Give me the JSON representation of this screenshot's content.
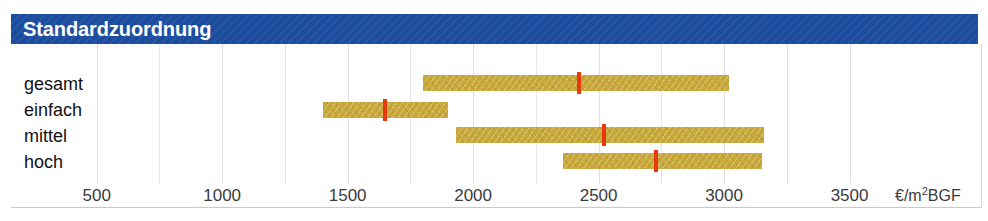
{
  "title": "Standardzuordnung",
  "colors": {
    "header_bg": "#1c4c9e",
    "header_text": "#ffffff",
    "bar_fill": "#c9a83a",
    "marker": "#e8380d",
    "gridline": "#e6e7ea",
    "text": "#111113"
  },
  "axis": {
    "unit_label": "€/m",
    "unit_exponent": "2",
    "unit_suffix": "BGF",
    "ticks": [
      {
        "label": "500",
        "value": 500
      },
      {
        "label": "1000",
        "value": 1000
      },
      {
        "label": "1500",
        "value": 1500
      },
      {
        "label": "2000",
        "value": 2000
      },
      {
        "label": "2500",
        "value": 2500
      },
      {
        "label": "3000",
        "value": 3000
      },
      {
        "label": "3500",
        "value": 3500
      }
    ],
    "gridline_values": [
      500,
      750,
      1000,
      1250,
      1500,
      1750,
      2000,
      2250,
      2500,
      2750,
      3000,
      3250,
      3500
    ]
  },
  "chart_data": {
    "type": "bar",
    "title": "Standardzuordnung",
    "xlabel": "€/m2 BGF",
    "ylabel": "",
    "orientation": "horizontal",
    "subtype": "range-bar-with-median-marker",
    "xlim": [
      380,
      3560
    ],
    "grid": true,
    "legend": false,
    "categories": [
      "gesamt",
      "einfach",
      "mittel",
      "hoch"
    ],
    "series": [
      {
        "name": "Spanne von",
        "values": [
          1800,
          1400,
          1930,
          2360
        ]
      },
      {
        "name": "Spanne bis",
        "values": [
          3020,
          1900,
          3160,
          3150
        ]
      },
      {
        "name": "Mittelwert",
        "values": [
          2420,
          1650,
          2520,
          2730
        ]
      }
    ],
    "rows": [
      {
        "label": "gesamt",
        "low": 1800,
        "high": 3020,
        "marker": 2420
      },
      {
        "label": "einfach",
        "low": 1400,
        "high": 1900,
        "marker": 1650
      },
      {
        "label": "mittel",
        "low": 1930,
        "high": 3160,
        "marker": 2520
      },
      {
        "label": "hoch",
        "low": 2360,
        "high": 3150,
        "marker": 2730
      }
    ]
  }
}
